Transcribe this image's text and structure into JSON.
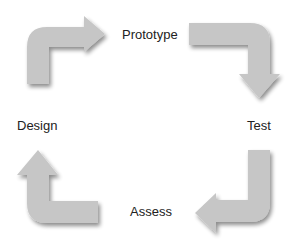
{
  "diagram": {
    "type": "cycle",
    "stages": [
      {
        "id": "prototype",
        "label": "Prototype"
      },
      {
        "id": "test",
        "label": "Test"
      },
      {
        "id": "assess",
        "label": "Assess"
      },
      {
        "id": "design",
        "label": "Design"
      }
    ],
    "arrows": [
      {
        "from": "design",
        "to": "prototype",
        "icon": "curved-arrow-up-right-icon"
      },
      {
        "from": "prototype",
        "to": "test",
        "icon": "curved-arrow-right-down-icon"
      },
      {
        "from": "test",
        "to": "assess",
        "icon": "curved-arrow-down-left-icon"
      },
      {
        "from": "assess",
        "to": "design",
        "icon": "curved-arrow-left-up-icon"
      }
    ],
    "colors": {
      "arrow_fill": "#c6c6c6",
      "arrow_shadow": "#9a9a9a",
      "text": "#222222",
      "background": "#ffffff"
    }
  }
}
